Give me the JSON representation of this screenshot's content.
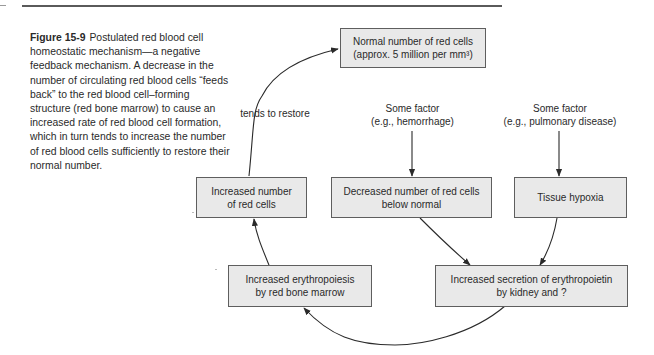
{
  "figure": {
    "number": "Figure 15-9",
    "caption": "Postulated red blood cell homeostatic mechanism—a negative feedback mechanism. A decrease in the number of circulating red blood cells “feeds back” to the red blood cell–forming structure (red bone marrow) to cause an increased rate of red blood cell formation, which in turn tends to increase the number of red blood cells sufficiently to restore their normal number."
  },
  "nodes": {
    "normal": {
      "line1": "Normal number of red cells",
      "line2": "(approx. 5 million per mm³)"
    },
    "increased_cells": "Increased number\nof red cells",
    "decreased_cells": "Decreased number of red cells\nbelow normal",
    "tissue_hypoxia": "Tissue hypoxia",
    "erythropoiesis": "Increased erythropoiesis\nby red bone marrow",
    "erythropoietin": "Increased secretion of erythropoietin\nby kidney and ?"
  },
  "labels": {
    "tends_to_restore": "tends to restore",
    "factor_hemorrhage": "Some factor\n(e.g., hemorrhage)",
    "factor_pulmonary": "Some factor\n(e.g., pulmonary disease)"
  },
  "colors": {
    "box_fill": "#e9e9e9",
    "box_border": "#5e5e5e",
    "line": "#2a2a2a"
  }
}
